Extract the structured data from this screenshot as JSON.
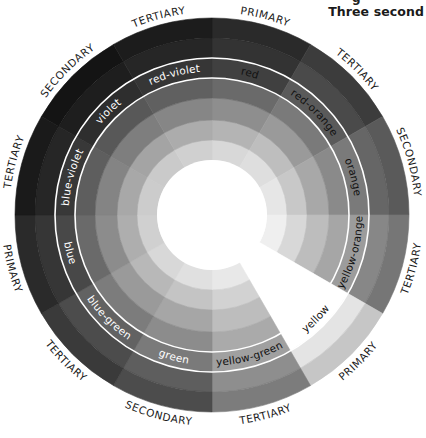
{
  "header": {
    "cut_line": "g",
    "title": "Three second"
  },
  "wheel": {
    "center": [
      212,
      215
    ],
    "ring_radii": [
      55,
      75,
      95,
      117,
      137,
      157,
      177,
      197
    ],
    "name_ring_index": 4,
    "ring_line_color": "#ffffff",
    "sectors": [
      {
        "name": "red",
        "type": "PRIMARY",
        "start": 0,
        "grays": [
          "#d8d8d8",
          "#b4b4b4",
          "#8e8e8e",
          "#6a6a6a",
          "#404040",
          "#333333",
          "#2a2a2a"
        ],
        "text_color": "#111111"
      },
      {
        "name": "red-orange",
        "type": "TERTIARY",
        "start": 30,
        "grays": [
          "#dedede",
          "#bebebe",
          "#9a9a9a",
          "#7a7a7a",
          "#5a5a5a",
          "#4a4a4a",
          "#3c3c3c"
        ],
        "text_color": "#111111"
      },
      {
        "name": "orange",
        "type": "SECONDARY",
        "start": 60,
        "grays": [
          "#e6e6e6",
          "#c8c8c8",
          "#a8a8a8",
          "#8a8a8a",
          "#7a7a7a",
          "#666666",
          "#5a5a5a"
        ],
        "text_color": "#111111"
      },
      {
        "name": "yellow-orange",
        "type": "TERTIARY",
        "start": 90,
        "grays": [
          "#efefef",
          "#d8d8d8",
          "#bdbdbd",
          "#a6a6a6",
          "#9c9c9c",
          "#878787",
          "#767676"
        ],
        "text_color": "#111111"
      },
      {
        "name": "yellow",
        "type": "PRIMARY",
        "start": 120,
        "grays": [
          "#ffffff",
          "#ffffff",
          "#ffffff",
          "#ffffff",
          "#ffffff",
          "#e4e4e4",
          "#c6c6c6"
        ],
        "text_color": "#111111"
      },
      {
        "name": "yellow-green",
        "type": "TERTIARY",
        "start": 150,
        "grays": [
          "#e8e8e8",
          "#d2d2d2",
          "#bdbdbd",
          "#aaaaaa",
          "#a0a0a0",
          "#8e8e8e",
          "#7c7c7c"
        ],
        "text_color": "#111111"
      },
      {
        "name": "green",
        "type": "SECONDARY",
        "start": 180,
        "grays": [
          "#e0e0e0",
          "#c4c4c4",
          "#a6a6a6",
          "#8c8c8c",
          "#7a7a7a",
          "#5e5e5e",
          "#4c4c4c"
        ],
        "text_color": "#ffffff"
      },
      {
        "name": "blue-green",
        "type": "TERTIARY",
        "start": 210,
        "grays": [
          "#d8d8d8",
          "#b8b8b8",
          "#9a9a9a",
          "#7c7c7c",
          "#626262",
          "#4c4c4c",
          "#3a3a3a"
        ],
        "text_color": "#ffffff"
      },
      {
        "name": "blue",
        "type": "PRIMARY",
        "start": 240,
        "grays": [
          "#d0d0d0",
          "#aeaeae",
          "#8c8c8c",
          "#6a6a6a",
          "#484848",
          "#363636",
          "#2a2a2a"
        ],
        "text_color": "#ffffff"
      },
      {
        "name": "blue-violet",
        "type": "TERTIARY",
        "start": 270,
        "grays": [
          "#cccccc",
          "#a8a8a8",
          "#848484",
          "#5e5e5e",
          "#383838",
          "#262626",
          "#1a1a1a"
        ],
        "text_color": "#ffffff"
      },
      {
        "name": "violet",
        "type": "SECONDARY",
        "start": 300,
        "grays": [
          "#cacaca",
          "#a4a4a4",
          "#7e7e7e",
          "#585858",
          "#2e2e2e",
          "#1e1e1e",
          "#141414"
        ],
        "text_color": "#ffffff"
      },
      {
        "name": "red-violet",
        "type": "TERTIARY",
        "start": 330,
        "grays": [
          "#d0d0d0",
          "#acacac",
          "#868686",
          "#606060",
          "#363636",
          "#262626",
          "#1c1c1c"
        ],
        "text_color": "#ffffff"
      }
    ],
    "outer_label_radius": 203
  }
}
